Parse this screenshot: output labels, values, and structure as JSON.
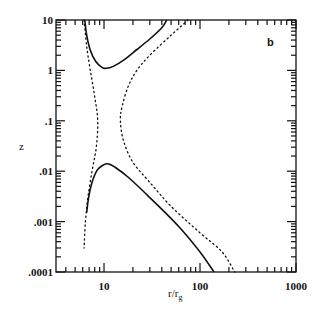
{
  "chart_data": {
    "type": "line",
    "title": "",
    "panel_label": "b",
    "xlabel": "r/r_g",
    "xlabel_main": "r/r",
    "xlabel_sub": "g",
    "ylabel": "z",
    "xscale": "log",
    "yscale": "log",
    "xlim": [
      3.16,
      1000
    ],
    "ylim": [
      0.0001,
      10
    ],
    "x_ticks": [
      {
        "value": 10,
        "label": "10"
      },
      {
        "value": 100,
        "label": "100"
      },
      {
        "value": 1000,
        "label": "1000"
      }
    ],
    "y_ticks": [
      {
        "value": 10,
        "label": "10"
      },
      {
        "value": 1,
        "label": "1"
      },
      {
        "value": 0.1,
        "label": ".1"
      },
      {
        "value": 0.01,
        "label": ".01"
      },
      {
        "value": 0.001,
        "label": ".001"
      },
      {
        "value": 0.0001,
        "label": ".0001"
      }
    ],
    "grid": false,
    "legend": null,
    "series": [
      {
        "name": "upper solid",
        "style": "solid",
        "points": [
          [
            6.3,
            10
          ],
          [
            6.6,
            5
          ],
          [
            7.2,
            2.5
          ],
          [
            8.2,
            1.5
          ],
          [
            9.5,
            1.15
          ],
          [
            10.5,
            1.1
          ],
          [
            12.5,
            1.2
          ],
          [
            16,
            1.6
          ],
          [
            22,
            2.6
          ],
          [
            30,
            4.2
          ],
          [
            40,
            7
          ],
          [
            45,
            10
          ]
        ]
      },
      {
        "name": "lower solid",
        "style": "solid",
        "points": [
          [
            6.6,
            0.0015
          ],
          [
            6.9,
            0.003
          ],
          [
            7.5,
            0.006
          ],
          [
            8.5,
            0.0105
          ],
          [
            10,
            0.0135
          ],
          [
            11,
            0.014
          ],
          [
            13,
            0.012
          ],
          [
            18,
            0.0075
          ],
          [
            30,
            0.003
          ],
          [
            60,
            0.0008
          ],
          [
            100,
            0.00025
          ],
          [
            140,
            0.0001
          ]
        ]
      },
      {
        "name": "left dotted",
        "style": "dotted",
        "points": [
          [
            6.2,
            10
          ],
          [
            6.6,
            3
          ],
          [
            7.2,
            1
          ],
          [
            8,
            0.3
          ],
          [
            8.6,
            0.1
          ],
          [
            8.3,
            0.03
          ],
          [
            7.5,
            0.01
          ],
          [
            6.8,
            0.003
          ],
          [
            6.4,
            0.001
          ],
          [
            6.2,
            0.0003
          ]
        ]
      },
      {
        "name": "right dotted",
        "style": "dotted",
        "points": [
          [
            75,
            10
          ],
          [
            50,
            5
          ],
          [
            30,
            2
          ],
          [
            22,
            1
          ],
          [
            18,
            0.5
          ],
          [
            15.5,
            0.2
          ],
          [
            14.8,
            0.1
          ],
          [
            16,
            0.04
          ],
          [
            20,
            0.015
          ],
          [
            30,
            0.006
          ],
          [
            50,
            0.002
          ],
          [
            100,
            0.0006
          ],
          [
            170,
            0.00025
          ],
          [
            230,
            0.0001
          ]
        ]
      }
    ]
  }
}
